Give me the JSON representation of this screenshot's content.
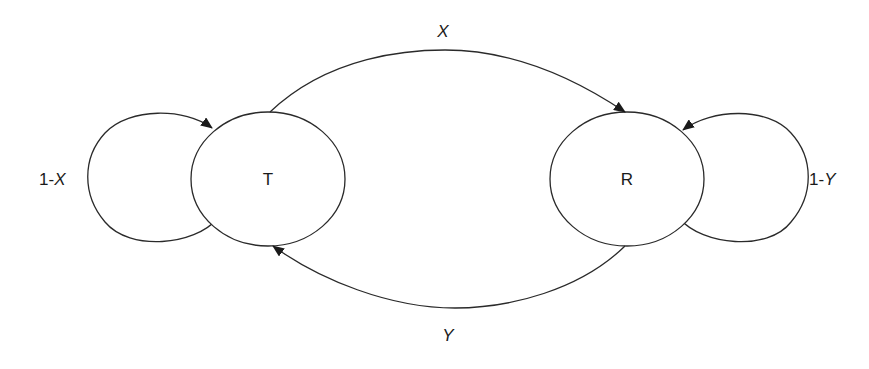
{
  "diagram": {
    "type": "state-transition",
    "nodes": [
      {
        "id": "T",
        "label": "T",
        "cx": 268,
        "cy": 179,
        "rx": 77,
        "ry": 67
      },
      {
        "id": "R",
        "label": "R",
        "cx": 627,
        "cy": 179,
        "rx": 77,
        "ry": 67
      }
    ],
    "edges": [
      {
        "from": "T",
        "to": "T",
        "label_prefix": "1-",
        "label_var": "X",
        "kind": "self-loop"
      },
      {
        "from": "T",
        "to": "R",
        "label_var": "X",
        "kind": "arc-top"
      },
      {
        "from": "R",
        "to": "R",
        "label_prefix": "1-",
        "label_var": "Y",
        "kind": "self-loop"
      },
      {
        "from": "R",
        "to": "T",
        "label_var": "Y",
        "kind": "arc-bottom"
      }
    ],
    "labels": {
      "top_arc": "X",
      "bottom_arc": "Y",
      "left_loop_prefix": "1-",
      "left_loop_var": "X",
      "right_loop_prefix": "1-",
      "right_loop_var": "Y",
      "node_t": "T",
      "node_r": "R"
    },
    "colors": {
      "stroke": "#2a2a2a",
      "text": "#1a1a1a",
      "background": "#ffffff"
    }
  }
}
